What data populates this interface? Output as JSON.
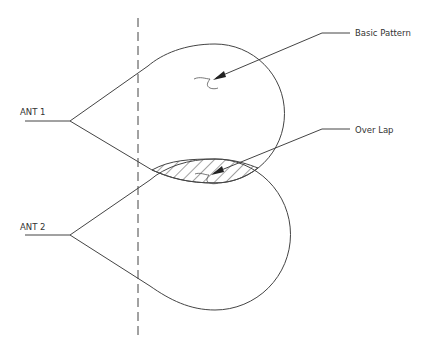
{
  "diagram": {
    "type": "antenna-radiation-pattern-overlap",
    "labels": {
      "ant1": "ANT 1",
      "ant2": "ANT 2",
      "basic_pattern": "Basic Pattern",
      "overlap": "Over Lap"
    },
    "colors": {
      "stroke": "#444444",
      "text": "#333333",
      "background": "#ffffff"
    },
    "elements": {
      "dashed_reference_line": {
        "x": 138,
        "y_start": 18,
        "y_end": 340
      },
      "antennas": [
        {
          "name": "ANT 1",
          "apex": [
            70,
            121
          ],
          "feed_start": [
            25,
            121
          ]
        },
        {
          "name": "ANT 2",
          "apex": [
            70,
            235
          ],
          "feed_start": [
            25,
            235
          ]
        }
      ],
      "lobes": [
        {
          "antenna": "ANT 1",
          "circle_center": [
            215,
            120
          ],
          "radius": 63
        },
        {
          "antenna": "ANT 2",
          "circle_center": [
            215,
            235
          ],
          "radius": 63
        }
      ],
      "callouts": [
        {
          "text": "Basic Pattern",
          "arrow_tip": [
            213,
            79
          ],
          "elbow": [
            322,
            33
          ],
          "end": [
            350,
            33
          ]
        },
        {
          "text": "Over Lap",
          "arrow_tip": [
            211,
            174
          ],
          "elbow": [
            322,
            129
          ],
          "end": [
            350,
            129
          ]
        }
      ]
    }
  }
}
